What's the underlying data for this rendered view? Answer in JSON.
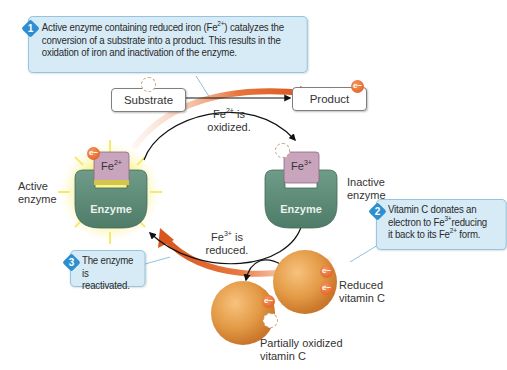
{
  "diagram": {
    "callouts": [
      {
        "step": "1",
        "text_parts": [
          "Active enzyme containing reduced iron (Fe",
          "2+",
          ") catalyzes the conversion of a substrate into a product. This results in the oxidation of iron and inactivation of the enzyme."
        ],
        "line1": "Active enzyme containing reduced iron (Fe",
        "line1_sup": "2+",
        "line1_end": ") catalyzes the",
        "line2": "conversion of a substrate into a product. This results in the",
        "line3": "oxidation of iron and inactivation of the enzyme."
      },
      {
        "step": "2",
        "line1": "Vitamin C donates an",
        "line2_pre": "electron to Fe",
        "line2_sup": "3+",
        "line2_end": "reducing",
        "line3_pre": "it back to its Fe",
        "line3_sup": "2+",
        "line3_end": " form."
      },
      {
        "step": "3",
        "line1": "The enzyme is",
        "line2": "reactivated."
      }
    ],
    "boxes": {
      "substrate": "Substrate",
      "product": "Product"
    },
    "arrow_labels": {
      "oxidized_pre": "Fe",
      "oxidized_sup": "2+",
      "oxidized_l1_end": " is",
      "oxidized_l2": "oxidized.",
      "reduced_pre": "Fe",
      "reduced_sup": "3+",
      "reduced_l1_end": " is",
      "reduced_l2": "reduced."
    },
    "enzymes": {
      "active": {
        "label_l1": "Active",
        "label_l2": "enzyme",
        "body": "Enzyme",
        "iron_pre": "Fe",
        "iron_sup": "2+"
      },
      "inactive": {
        "label_l1": "Inactive",
        "label_l2": "enzyme",
        "body": "Enzyme",
        "iron_pre": "Fe",
        "iron_sup": "3+"
      }
    },
    "vitamin_c": {
      "reduced_l1": "Reduced",
      "reduced_l2": "vitamin C",
      "partial_l1": "Partially oxidized",
      "partial_l2": "vitamin C"
    },
    "electron_symbol": "e−",
    "colors": {
      "callout_bg": "#d7ebf6",
      "callout_border": "#8fc2df",
      "step_badge": "#2d8fd0",
      "enzyme_green": "#5e8c78",
      "iron_active": "#c9a4bd",
      "iron_inactive": "#c9a4bd",
      "electron": "#e0622a",
      "vitamin_c": "#e39a45",
      "flow_arrow": "#d9561f",
      "glow": "#f7ec6a"
    }
  }
}
